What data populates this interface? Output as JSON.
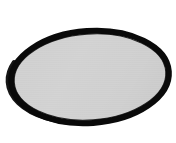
{
  "image": {
    "title": "Oval mesh screen",
    "subject": "oval-shaped fine-mesh screen with thick black rim",
    "width": 176,
    "height": 143,
    "background_color": "#ffffff",
    "alt_text": "A wide oval with a thick solid black border and a light gray finely-textured mesh interior, centered on a plain white background."
  },
  "shape": {
    "name": "oval-mesh-panel",
    "type": "ellipse",
    "center_x": 90,
    "center_y": 77,
    "radius_x": 82,
    "radius_y": 49,
    "rotation_deg": -4,
    "bounds": {
      "left": 8,
      "top": 28,
      "right": 172,
      "bottom": 126
    }
  },
  "rim": {
    "name": "black-rim",
    "color": "#0a0a0a",
    "thickness_min_px": 4,
    "thickness_max_px": 8,
    "description": "solid black outer rim, thicker along the lower-left, thinner along the top"
  },
  "mesh": {
    "name": "gray-mesh-fill",
    "base_color": "#d0d0d0",
    "highlight_color": "#d8d8d8",
    "shadow_color": "#c2c2c2",
    "line_color": "#c6c6c6",
    "line_spacing_px": 2,
    "line_orientation": "horizontal",
    "description": "light gray interior with faint evenly spaced horizontal mesh lines"
  },
  "palette": {
    "white": "#ffffff",
    "black": "#0a0a0a",
    "light_gray": "#d0d0d0",
    "mid_gray": "#c2c2c2"
  }
}
